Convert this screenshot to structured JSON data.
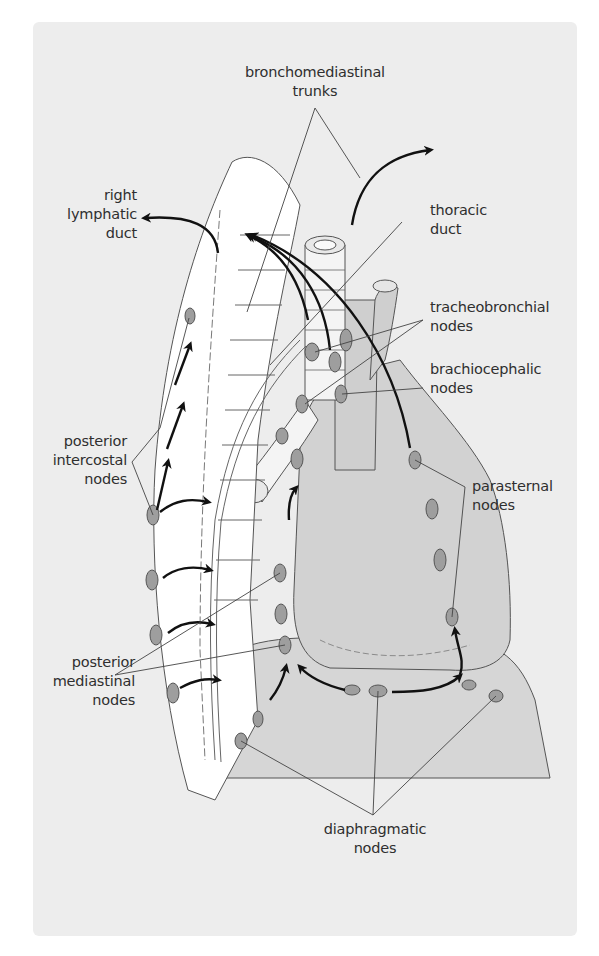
{
  "figure": {
    "colors": {
      "background_panel": "#ededed",
      "tissue_fill": "#d6d6d6",
      "vertebral_column": "#ffffff",
      "node_fill": "#9e9e9e",
      "outline": "#555555",
      "arrow": "#111111",
      "text": "#2f2f2f"
    }
  },
  "labels": {
    "bronchomediastinal_trunks": {
      "line1": "bronchomediastinal",
      "line2": "trunks"
    },
    "right_lymphatic_duct": {
      "line1": "right",
      "line2": "lymphatic",
      "line3": "duct"
    },
    "thoracic_duct": {
      "line1": "thoracic",
      "line2": "duct"
    },
    "tracheobronchial_nodes": {
      "line1": "tracheobronchial",
      "line2": "nodes"
    },
    "brachiocephalic_nodes": {
      "line1": "brachiocephalic",
      "line2": "nodes"
    },
    "posterior_intercostal_nodes": {
      "line1": "posterior",
      "line2": "intercostal",
      "line3": "nodes"
    },
    "parasternal_nodes": {
      "line1": "parasternal",
      "line2": "nodes"
    },
    "posterior_mediastinal_nodes": {
      "line1": "posterior",
      "line2": "mediastinal",
      "line3": "nodes"
    },
    "diaphragmatic_nodes": {
      "line1": "diaphragmatic",
      "line2": "nodes"
    }
  }
}
